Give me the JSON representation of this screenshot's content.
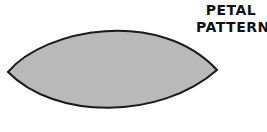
{
  "title": {
    "line1": "PETAL",
    "line2": "PATTERN"
  },
  "shape": {
    "name": "petal",
    "fill": "#b9b9b9",
    "stroke": "#1a1a1a"
  }
}
